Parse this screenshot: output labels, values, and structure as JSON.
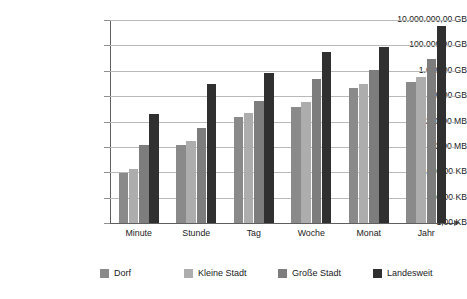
{
  "chart_data": {
    "type": "bar",
    "title": "",
    "subtitle": "",
    "xlabel": "",
    "ylabel": "",
    "scale": "log",
    "grid": true,
    "legend_position": "bottom",
    "categories": [
      "Minute",
      "Stunde",
      "Tag",
      "Woche",
      "Monat",
      "Jahr"
    ],
    "ytick_labels": [
      "10.000.000,00 GB",
      "100.000,00 GB",
      "1.000,00 GB",
      "10,00 GB",
      "100,00 MB",
      "1,00 MB",
      "10.000,00 KB",
      "100,00 KB",
      "1,00 KB"
    ],
    "ytick_values_kb": [
      10000000000000,
      100000000000,
      1000000000,
      10000000,
      100000,
      1000,
      10000,
      100,
      1
    ],
    "ylim_labels": [
      "1,00 KB",
      "10.000.000,00 GB"
    ],
    "series": [
      {
        "name": "Dorf",
        "color": "#8a8a8a",
        "values_display": [
          "1,50 MB",
          "90,00 MB",
          "5,50 GB",
          "25,00 GB",
          "400,00 GB",
          "1.000,00 GB"
        ],
        "values_kb": [
          1500,
          92160,
          5767168,
          26214400,
          419430400,
          1048576000
        ]
      },
      {
        "name": "Kleine Stadt",
        "color": "#adadad",
        "values_display": [
          "3,00 MB",
          "180,00 MB",
          "11,00 GB",
          "50,00 GB",
          "800,00 GB",
          "2.000,00 GB"
        ],
        "values_kb": [
          3000,
          184320,
          11534336,
          52428800,
          838860800,
          2097152000
        ]
      },
      {
        "name": "Große Stadt",
        "color": "#7d7d7d",
        "values_display": [
          "90,00 MB",
          "1,20 GB",
          "60,00 GB",
          "1.500,00 GB",
          "6.000,00 GB",
          "30.000,00 GB"
        ],
        "values_kb": [
          92160,
          1258291,
          62914560,
          1572864000,
          6291456000,
          31457280000
        ]
      },
      {
        "name": "Landesweit",
        "color": "#303030",
        "values_display": [
          "9,00 GB",
          "800,00 GB",
          "4.000,00 GB",
          "90.000,00 GB",
          "180.000,00 GB",
          "4.000.000,00 GB"
        ],
        "values_kb": [
          9437184,
          838860800,
          4194304000,
          94371840000,
          188743680000,
          4194304000000
        ]
      }
    ]
  },
  "legend": {
    "items": [
      {
        "label": "Dorf"
      },
      {
        "label": "Kleine Stadt"
      },
      {
        "label": "Große Stadt"
      },
      {
        "label": "Landesweit"
      }
    ]
  }
}
